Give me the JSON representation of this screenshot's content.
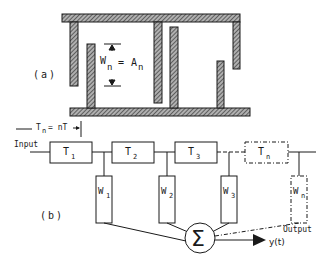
{
  "figure": {
    "part_a": {
      "label": "(a)",
      "electrode_label": "W",
      "electrode_sub": "n",
      "equals": "=",
      "amplitude_label": "A",
      "amplitude_sub": "n"
    },
    "part_b": {
      "label": "(b)",
      "delay_label": "T",
      "delay_sub": "n",
      "delay_value": "= nT",
      "input_label": "Input",
      "output_label": "Output",
      "sum_symbol": "Σ",
      "output_signal": "y(t)",
      "delay_taps": [
        {
          "label": "T",
          "sub": "1",
          "style": "solid"
        },
        {
          "label": "T",
          "sub": "2",
          "style": "solid"
        },
        {
          "label": "T",
          "sub": "3",
          "style": "solid"
        },
        {
          "label": "T",
          "sub": "n",
          "style": "dashed"
        }
      ],
      "weights": [
        {
          "label": "W",
          "sub": "1",
          "style": "solid"
        },
        {
          "label": "W",
          "sub": "2",
          "style": "solid"
        },
        {
          "label": "W",
          "sub": "3",
          "style": "solid"
        },
        {
          "label": "W",
          "sub": "n",
          "style": "dashed"
        }
      ]
    },
    "colors": {
      "ink": "#1a1a1a",
      "hatch_fill": "#8a8a8a",
      "background": "#ffffff"
    }
  }
}
